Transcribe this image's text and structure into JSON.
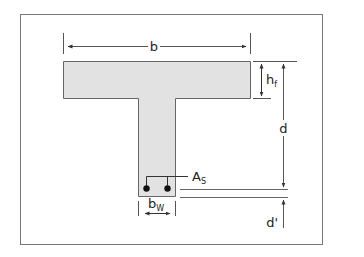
{
  "diagram": {
    "labels": {
      "b": "b",
      "hf_main": "h",
      "hf_sub": "f",
      "d": "d",
      "as_main": "A",
      "as_sub": "S",
      "bw_main": "b",
      "bw_sub": "W",
      "d_prime": "d'"
    },
    "colors": {
      "section_fill": "#e2e2e2",
      "line": "#555555",
      "frame": "#777777",
      "rebar": "#111111"
    }
  }
}
